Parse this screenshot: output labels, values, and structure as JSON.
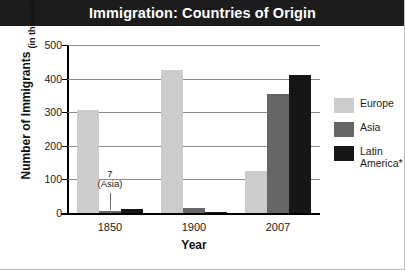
{
  "title": "Immigration: Countries of Origin",
  "colors": {
    "banner_background": "#1c1c1c",
    "banner_text": "#ffffff",
    "europe": "#cccccc",
    "asia": "#666666",
    "latin_america": "#161616",
    "gridline": "#8a8a8a",
    "axis": "#000000"
  },
  "annotation": {
    "value": "7",
    "note": "(Asia)"
  },
  "legend": {
    "position": "right",
    "items": [
      {
        "label": "Europe",
        "color": "#cccccc"
      },
      {
        "label": "Asia",
        "color": "#666666"
      },
      {
        "label": "Latin\nAmerica*",
        "color": "#161616"
      }
    ]
  },
  "chart_data": {
    "type": "bar",
    "title": "Immigration: Countries of Origin",
    "xlabel": "Year",
    "ylabel": "Number of Immigrants",
    "ylabel_sub": "(in thousands)",
    "categories": [
      "1850",
      "1900",
      "2007"
    ],
    "series": [
      {
        "name": "Europe",
        "color": "#cccccc",
        "values": [
          308,
          425,
          125
        ]
      },
      {
        "name": "Asia",
        "color": "#666666",
        "values": [
          7,
          15,
          353
        ]
      },
      {
        "name": "Latin America*",
        "color": "#161616",
        "values": [
          13,
          3,
          410
        ]
      }
    ],
    "ylim": [
      0,
      500
    ],
    "yticks": [
      0,
      100,
      200,
      300,
      400,
      500
    ],
    "ytick_labels": [
      "0",
      "100",
      "200",
      "300",
      "400",
      "500"
    ],
    "grid": true,
    "annotations": [
      {
        "text": "7",
        "subtext": "(Asia)",
        "series": "Asia",
        "category": "1850",
        "value": 7
      }
    ]
  }
}
